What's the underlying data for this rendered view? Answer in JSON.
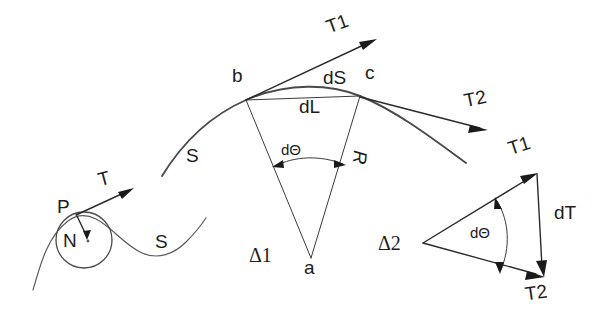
{
  "figure": {
    "width": 611,
    "height": 331,
    "background_color": "#ffffff",
    "ink_color": "#1c1c1c"
  },
  "labels": {
    "point_p": "P",
    "normal_force": "N",
    "tension_left": "T",
    "strand_s_left": "S",
    "strand_s_arc": "S",
    "point_b": "b",
    "point_c": "c",
    "point_a": "a",
    "arc_length": "dS",
    "chord_length": "dL",
    "radius": "R",
    "delta_theta_arc": "dΘ",
    "delta_theta_tri": "dΘ",
    "triangle_one": "Δ1",
    "triangle_two": "Δ2",
    "tension_t1_top": "T1",
    "tension_t2_mid": "T2",
    "tension_t1_tri": "T1",
    "tension_t2_tri": "T2",
    "tension_delta": "dT"
  },
  "geometry": {
    "circle_center": [
      84,
      240
    ],
    "circle_radius": 28,
    "point_p_xy": [
      76,
      215
    ],
    "arc_center_a": [
      311,
      258
    ],
    "point_b_xy": [
      246,
      99
    ],
    "point_c_xy": [
      360,
      96
    ],
    "triangle2_vertices": [
      [
        423,
        243
      ],
      [
        537,
        173
      ],
      [
        545,
        278
      ]
    ]
  }
}
